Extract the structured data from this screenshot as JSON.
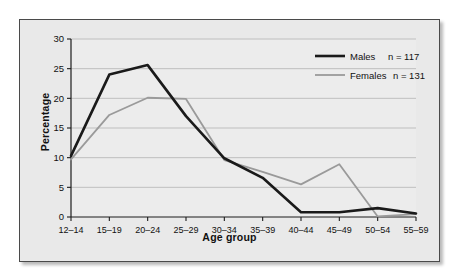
{
  "chart_data": {
    "type": "line",
    "title": "",
    "xlabel": "Age group",
    "ylabel": "Percentage",
    "categories": [
      "12–14",
      "15–19",
      "20–24",
      "25–29",
      "30–34",
      "35–39",
      "40–44",
      "45–49",
      "50–54",
      "55–59"
    ],
    "ylim": [
      0,
      30
    ],
    "yticks": [
      0,
      5,
      10,
      15,
      20,
      25,
      30
    ],
    "ytick_labels": [
      "0",
      "5",
      "10",
      "15",
      "20",
      "25",
      "30"
    ],
    "grid": true,
    "legend_position": "top-right",
    "series": [
      {
        "name": "Males",
        "annotation": "n = 117",
        "color": "#1a1a1a",
        "values": [
          10.3,
          24.0,
          25.6,
          17.0,
          9.9,
          6.6,
          0.8,
          0.8,
          1.5,
          0.6
        ]
      },
      {
        "name": "Females",
        "annotation": "n = 131",
        "color": "#9a9a9a",
        "values": [
          9.7,
          17.2,
          20.1,
          19.9,
          9.6,
          7.6,
          5.5,
          8.9,
          0.1,
          0.5
        ]
      }
    ]
  },
  "legend": {
    "entries": [
      {
        "label": "Males",
        "n_label": "n = 117"
      },
      {
        "label": "Females",
        "n_label": "n = 131"
      }
    ]
  },
  "axes": {
    "x_title": "Age group",
    "y_title": "Percentage"
  },
  "colors": {
    "males": "#1a1a1a",
    "females": "#9a9a9a",
    "background": "#e9e9e9",
    "frame": "#4a4a4a",
    "grid": "#b4b4b4"
  }
}
